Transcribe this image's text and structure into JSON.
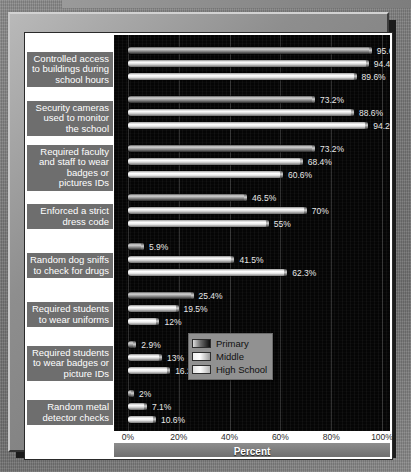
{
  "chart_data": {
    "type": "bar",
    "orientation": "horizontal",
    "title": "",
    "xlabel": "Percent",
    "ylabel": "",
    "xlim": [
      0,
      100
    ],
    "xticks": [
      "0%",
      "20%",
      "40%",
      "60%",
      "80%",
      "100%"
    ],
    "xtick_values": [
      0,
      20,
      40,
      60,
      80,
      100
    ],
    "grid": true,
    "legend_position": "inside-right",
    "categories": [
      "Controlled access to buildings during school hours",
      "Security cameras used to monitor the school",
      "Required faculty and staff to wear badges or pictures IDs",
      "Enforced a strict dress code",
      "Random dog sniffs to check for drugs",
      "Required students to wear uniforms",
      "Required students to wear badges or picture IDs",
      "Random metal detector checks"
    ],
    "category_lines": [
      [
        "Controlled access",
        "to buildings during",
        "school hours"
      ],
      [
        "Security cameras",
        "used to monitor",
        "the school"
      ],
      [
        "Required faculty",
        "and staff to wear",
        "badges or",
        "pictures IDs"
      ],
      [
        "Enforced a strict",
        "dress code"
      ],
      [
        "Random dog sniffs",
        "to check for drugs"
      ],
      [
        "Required students",
        "to wear uniforms"
      ],
      [
        "Required students",
        "to wear badges or",
        "picture IDs"
      ],
      [
        "Random metal",
        "detector checks"
      ]
    ],
    "series": [
      {
        "name": "Primary",
        "key": "primary",
        "values": [
          95.6,
          73.2,
          73.2,
          46.5,
          5.9,
          25.4,
          2.9,
          2
        ],
        "labels": [
          "95.6%",
          "73.2%",
          "73.2%",
          "46.5%",
          "5.9%",
          "25.4%",
          "2.9%",
          "2%"
        ]
      },
      {
        "name": "Middle",
        "key": "middle",
        "values": [
          94.4,
          88.6,
          68.4,
          70,
          41.5,
          19.5,
          13,
          7.1
        ],
        "labels": [
          "94.4%",
          "88.6%",
          "68.4%",
          "70%",
          "41.5%",
          "19.5%",
          "13%",
          "7.1%"
        ]
      },
      {
        "name": "High School",
        "key": "high",
        "values": [
          89.6,
          94.2,
          60.6,
          55,
          62.3,
          12,
          16.2,
          10.6
        ],
        "labels": [
          "89.6%",
          "94.2%",
          "60.6%",
          "55%",
          "62.3%",
          "12%",
          "16.2%",
          "10.6%"
        ]
      }
    ],
    "colors": {
      "plot_background": "#050505",
      "label_band": "#6e6e6e",
      "label_text": "#ffffff",
      "value_text": "#e8e8e8",
      "legend_background": "#919191",
      "frame": "#8e8e8e",
      "page_background": "#7b7b7b"
    }
  },
  "legend": {
    "items": [
      {
        "label": "Primary",
        "key": "primary"
      },
      {
        "label": "Middle",
        "key": "middle"
      },
      {
        "label": "High School",
        "key": "high"
      }
    ]
  },
  "axis": {
    "title": "Percent"
  }
}
